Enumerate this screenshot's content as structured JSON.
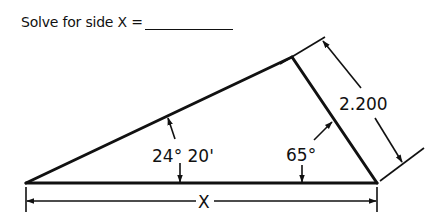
{
  "problem": {
    "prompt": "Solve for side X =",
    "answer_value": ""
  },
  "diagram": {
    "type": "right-less triangle, solve for side",
    "vertices": {
      "left": [
        26,
        183
      ],
      "right": [
        377,
        183
      ],
      "top": [
        292,
        57
      ]
    },
    "angles": {
      "left_angle_label": "24° 20'",
      "right_angle_label": "65°"
    },
    "dimensions": {
      "right_side_label": "2.200",
      "base_label": "X"
    },
    "colors": {
      "line": "#111111",
      "background": "#ffffff"
    }
  }
}
